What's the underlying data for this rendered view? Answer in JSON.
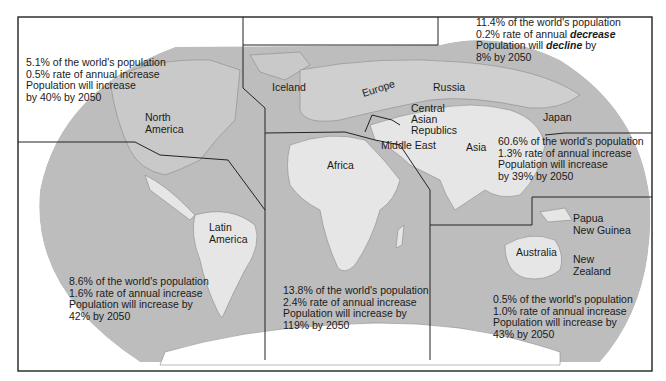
{
  "map": {
    "colors": {
      "ocean": "#bdbdbd",
      "land_highlight": "#e6e6e6",
      "land": "#c8c8c8",
      "border": "#222222",
      "background": "#ffffff"
    },
    "region_labels": {
      "north_america": [
        "North",
        "America"
      ],
      "latin_america": [
        "Latin",
        "America"
      ],
      "iceland": "Iceland",
      "europe": "Europe",
      "russia": "Russia",
      "central_asia": [
        "Central",
        "Asian",
        "Republics"
      ],
      "middle_east": "Middle East",
      "africa": "Africa",
      "asia": "Asia",
      "japan": "Japan",
      "papua": [
        "Papua",
        "New Guinea"
      ],
      "australia": "Australia",
      "new_zealand": [
        "New",
        "Zealand"
      ]
    },
    "stats": {
      "north_america": {
        "share": "5.1% of the world's population",
        "rate": "0.5% rate of annual increase",
        "line3": "Population will increase",
        "line4": "by 40% by 2050"
      },
      "russia": {
        "share": "11.4% of the world's population",
        "rate_prefix": "0.2% rate of annual ",
        "rate_emph": "decrease",
        "line3_prefix": "Population will ",
        "line3_emph": "decline",
        "line3_suffix": " by",
        "line4": "8% by 2050"
      },
      "asia": {
        "share": "60.6% of the world's population",
        "rate": "1.3% rate of annual increase",
        "line3": "Population will increase",
        "line4": "by 39% by 2050"
      },
      "latin_america": {
        "share": "8.6% of the world's population",
        "rate": "1.6% rate of annual increase",
        "line3": "Population will increase by",
        "line4": "42% by 2050"
      },
      "africa": {
        "share": "13.8% of the world's population",
        "rate": "2.4% rate of annual increase",
        "line3": "Population will increase by",
        "line4": "119% by 2050"
      },
      "oceania": {
        "share": "0.5% of the world's population",
        "rate": "1.0% rate of annual increase",
        "line3": "Population will increase by",
        "line4": "43% by 2050"
      }
    }
  }
}
